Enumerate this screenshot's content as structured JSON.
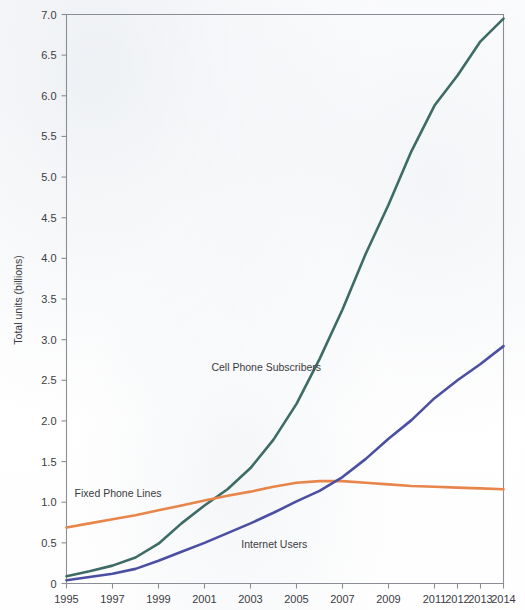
{
  "chart_data": {
    "type": "line",
    "title": "",
    "xlabel": "",
    "ylabel": "Total units (billions)",
    "xlim": [
      1995,
      2014
    ],
    "ylim": [
      0,
      7.0
    ],
    "grid": false,
    "legend_position": "inline-labels",
    "x": [
      1995,
      1996,
      1997,
      1998,
      1999,
      2000,
      2001,
      2002,
      2003,
      2004,
      2005,
      2006,
      2007,
      2008,
      2009,
      2010,
      2011,
      2012,
      2013,
      2014
    ],
    "xtick_labels": [
      "1995",
      "1997",
      "1999",
      "2001",
      "2003",
      "2005",
      "2007",
      "2009",
      "2011",
      "2012",
      "2013",
      "2014"
    ],
    "xtick_values": [
      1995,
      1997,
      1999,
      2001,
      2003,
      2005,
      2007,
      2009,
      2011,
      2012,
      2013,
      2014
    ],
    "ytick_labels": [
      "0",
      "0.5",
      "1.0",
      "1.5",
      "2.0",
      "2.5",
      "3.0",
      "3.5",
      "4.0",
      "4.5",
      "5.0",
      "5.5",
      "6.0",
      "6.5",
      "7.0"
    ],
    "ytick_values": [
      0,
      0.5,
      1.0,
      1.5,
      2.0,
      2.5,
      3.0,
      3.5,
      4.0,
      4.5,
      5.0,
      5.5,
      6.0,
      6.5,
      7.0
    ],
    "series": [
      {
        "name": "Cell Phone Subscribers",
        "color": "#3d6b66",
        "label_x": 2001.3,
        "label_y": 2.62,
        "values": [
          0.09,
          0.15,
          0.22,
          0.32,
          0.49,
          0.74,
          0.96,
          1.16,
          1.42,
          1.77,
          2.21,
          2.76,
          3.37,
          4.05,
          4.66,
          5.32,
          5.88,
          6.25,
          6.67,
          6.95
        ]
      },
      {
        "name": "Fixed Phone Lines",
        "color": "#e8854a",
        "label_x": 1995.35,
        "label_y": 1.07,
        "values": [
          0.69,
          0.74,
          0.79,
          0.84,
          0.9,
          0.96,
          1.02,
          1.08,
          1.13,
          1.19,
          1.24,
          1.26,
          1.26,
          1.24,
          1.22,
          1.2,
          1.19,
          1.18,
          1.17,
          1.16
        ]
      },
      {
        "name": "Internet Users",
        "color": "#4b4fa2",
        "label_x": 2002.6,
        "label_y": 0.44,
        "values": [
          0.04,
          0.08,
          0.12,
          0.18,
          0.28,
          0.39,
          0.5,
          0.62,
          0.74,
          0.87,
          1.01,
          1.14,
          1.31,
          1.53,
          1.78,
          2.01,
          2.28,
          2.5,
          2.7,
          2.92
        ]
      }
    ]
  },
  "axes": {
    "y_title": "Total units (billions)"
  }
}
